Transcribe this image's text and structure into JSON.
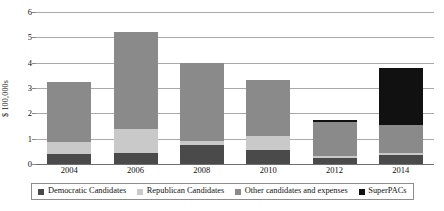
{
  "chart_data": {
    "type": "bar",
    "stacked": true,
    "title": "",
    "xlabel": "",
    "ylabel": "$ 100,000s",
    "categories": [
      "2004",
      "2006",
      "2008",
      "2010",
      "2012",
      "2014"
    ],
    "ylim": [
      0,
      6
    ],
    "yticks": [
      0,
      1,
      2,
      3,
      4,
      5,
      6
    ],
    "ytick_labels": [
      "0",
      "1",
      "2",
      "3",
      "4",
      "5",
      "6"
    ],
    "grid": true,
    "legend_position": "bottom",
    "series": [
      {
        "name": "Democratic Candidates",
        "color": "#4a4a4a",
        "values": [
          0.4,
          0.45,
          0.75,
          0.55,
          0.25,
          0.35
        ]
      },
      {
        "name": "Republican Candidates",
        "color": "#c9c9c9",
        "values": [
          0.45,
          0.95,
          0.15,
          0.55,
          0.05,
          0.1
        ]
      },
      {
        "name": "Other candidates and expenses",
        "color": "#8a8a8a",
        "values": [
          2.4,
          3.8,
          3.1,
          2.2,
          1.35,
          1.1
        ]
      },
      {
        "name": "SuperPACs",
        "color": "#111111",
        "values": [
          0.0,
          0.0,
          0.0,
          0.0,
          0.1,
          2.25
        ]
      }
    ],
    "totals": [
      3.25,
      5.2,
      4.0,
      3.3,
      1.75,
      3.8
    ]
  }
}
